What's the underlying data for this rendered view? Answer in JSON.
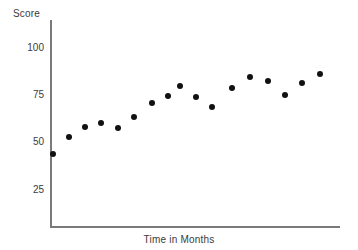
{
  "chart_data": {
    "type": "scatter",
    "title": "",
    "xlabel": "Time in Months",
    "ylabel": "Score",
    "grid": false,
    "legend": false,
    "ylim": [
      0,
      112
    ],
    "yticks": [
      100,
      75,
      50,
      25
    ],
    "ytick_labels": [
      "100",
      "75",
      "50",
      "25"
    ],
    "xticks": [],
    "xtick_labels": [],
    "x": [
      1,
      2,
      3,
      4,
      5,
      6,
      7,
      8,
      9,
      10,
      11,
      12,
      13,
      14,
      15,
      16,
      17
    ],
    "y": [
      44,
      53,
      58,
      60,
      57,
      63,
      71,
      75,
      80,
      74,
      69,
      80,
      86,
      84,
      77,
      84,
      88
    ],
    "series": [
      {
        "name": "Score",
        "marker": "circle",
        "color": "#111111",
        "points": [
          {
            "px": 53,
            "py": 154,
            "x": 1,
            "y": 44
          },
          {
            "px": 69,
            "py": 137,
            "x": 2,
            "y": 53
          },
          {
            "px": 85,
            "py": 127,
            "x": 3,
            "y": 58
          },
          {
            "px": 101,
            "py": 123,
            "x": 4,
            "y": 60
          },
          {
            "px": 118,
            "py": 128,
            "x": 5,
            "y": 57
          },
          {
            "px": 134,
            "py": 117,
            "x": 6,
            "y": 63
          },
          {
            "px": 152,
            "py": 103,
            "x": 7,
            "y": 71
          },
          {
            "px": 168,
            "py": 96,
            "x": 8,
            "y": 75
          },
          {
            "px": 180,
            "py": 86,
            "x": 9,
            "y": 80
          },
          {
            "px": 196,
            "py": 97,
            "x": 10,
            "y": 74
          },
          {
            "px": 212,
            "py": 107,
            "x": 11,
            "y": 69
          },
          {
            "px": 232,
            "py": 88,
            "x": 12,
            "y": 80
          },
          {
            "px": 250,
            "py": 77,
            "x": 13,
            "y": 86
          },
          {
            "px": 268,
            "py": 81,
            "x": 14,
            "y": 84
          },
          {
            "px": 285,
            "py": 95,
            "x": 15,
            "y": 77
          },
          {
            "px": 302,
            "py": 83,
            "x": 16,
            "y": 84
          },
          {
            "px": 320,
            "py": 74,
            "x": 17,
            "y": 88
          }
        ]
      }
    ]
  },
  "axes": {
    "y_label": "Score",
    "x_label": "Time in Months",
    "axis_color": "#7a7a7a",
    "tick_positions_px": [
      48,
      95,
      142,
      190
    ]
  }
}
